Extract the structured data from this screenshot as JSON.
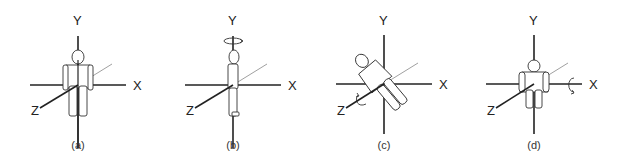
{
  "figure": {
    "panels": [
      {
        "id": "a",
        "caption": "(a)",
        "axis_labels": {
          "x": "X",
          "y": "Y",
          "z": "Z"
        },
        "pose": "standing-front",
        "rotation": "none"
      },
      {
        "id": "b",
        "caption": "(b)",
        "axis_labels": {
          "x": "X",
          "y": "Y",
          "z": "Z"
        },
        "pose": "standing-side",
        "rotation": "about-y-axis"
      },
      {
        "id": "c",
        "caption": "(c)",
        "axis_labels": {
          "x": "X",
          "y": "Y",
          "z": "Z"
        },
        "pose": "tilted-diagonal",
        "rotation": "about-z-axis"
      },
      {
        "id": "d",
        "caption": "(d)",
        "axis_labels": {
          "x": "X",
          "y": "Y",
          "z": "Z"
        },
        "pose": "seated-front",
        "rotation": "about-x-axis"
      }
    ],
    "colors": {
      "line": "#222222",
      "figure_stroke": "#333333",
      "background": "#ffffff"
    }
  }
}
